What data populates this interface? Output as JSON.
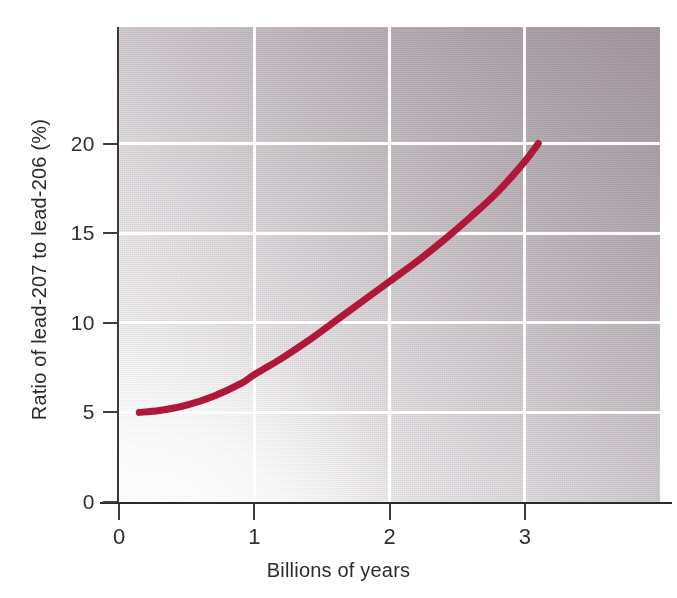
{
  "chart_data": {
    "type": "line",
    "title": "",
    "subtitle": "",
    "xlabel": "Billions of years",
    "ylabel": "Ratio of lead-207 to lead-206 (%)",
    "xlim": [
      0,
      4.0
    ],
    "ylim": [
      0,
      26.5
    ],
    "xticks": [
      "0",
      "1",
      "2",
      "3"
    ],
    "xtick_values": [
      0,
      1,
      2,
      3
    ],
    "yticks": [
      "0",
      "5",
      "10",
      "15",
      "20"
    ],
    "ytick_values": [
      0,
      5,
      10,
      15,
      20
    ],
    "grid": true,
    "grid_color": "#ffffff",
    "legend": false,
    "legend_position": "none",
    "series": [
      {
        "name": "lead-207 / lead-206 ratio",
        "color": "#b01739",
        "line_width": 7,
        "x": [
          0.15,
          0.3,
          0.5,
          0.7,
          0.9,
          1.0,
          1.2,
          1.4,
          1.6,
          1.8,
          2.0,
          2.2,
          2.4,
          2.6,
          2.8,
          3.0,
          3.1
        ],
        "values": [
          5.0,
          5.1,
          5.4,
          5.9,
          6.6,
          7.1,
          8.0,
          9.0,
          10.1,
          11.2,
          12.3,
          13.4,
          14.6,
          15.9,
          17.3,
          19.0,
          20.0
        ]
      }
    ],
    "annotations": []
  },
  "figure": {
    "background_color": "#ffffff",
    "plot_background_gradient_from": "#fdfdfd",
    "plot_background_gradient_to": "#a79ba2",
    "axis_color": "#2b2b2b"
  }
}
